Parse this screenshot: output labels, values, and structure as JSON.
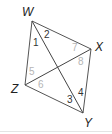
{
  "figure": {
    "type": "quadrilateral with diagonals",
    "vertices": [
      {
        "name": "W",
        "x": 32,
        "y": 21,
        "label_x": 22,
        "label_y": 16
      },
      {
        "name": "X",
        "x": 91,
        "y": 49,
        "label_x": 95,
        "label_y": 51
      },
      {
        "name": "Y",
        "x": 83,
        "y": 113,
        "label_x": 84,
        "label_y": 127
      },
      {
        "name": "Z",
        "x": 25,
        "y": 85,
        "label_x": 11,
        "label_y": 93
      }
    ],
    "angles": [
      {
        "label": "1",
        "x": 33,
        "y": 46,
        "shade": "dark"
      },
      {
        "label": "2",
        "x": 44,
        "y": 38,
        "shade": "dark"
      },
      {
        "label": "7",
        "x": 72,
        "y": 51,
        "shade": "light"
      },
      {
        "label": "8",
        "x": 78,
        "y": 65,
        "shade": "light"
      },
      {
        "label": "5",
        "x": 29,
        "y": 75,
        "shade": "light"
      },
      {
        "label": "6",
        "x": 38,
        "y": 88,
        "shade": "light"
      },
      {
        "label": "3",
        "x": 67,
        "y": 103,
        "shade": "dark"
      },
      {
        "label": "4",
        "x": 78,
        "y": 96,
        "shade": "dark"
      }
    ],
    "colors": {
      "edge": "#555555",
      "label_dark": "#333333",
      "label_light": "#b5b5b5"
    }
  }
}
